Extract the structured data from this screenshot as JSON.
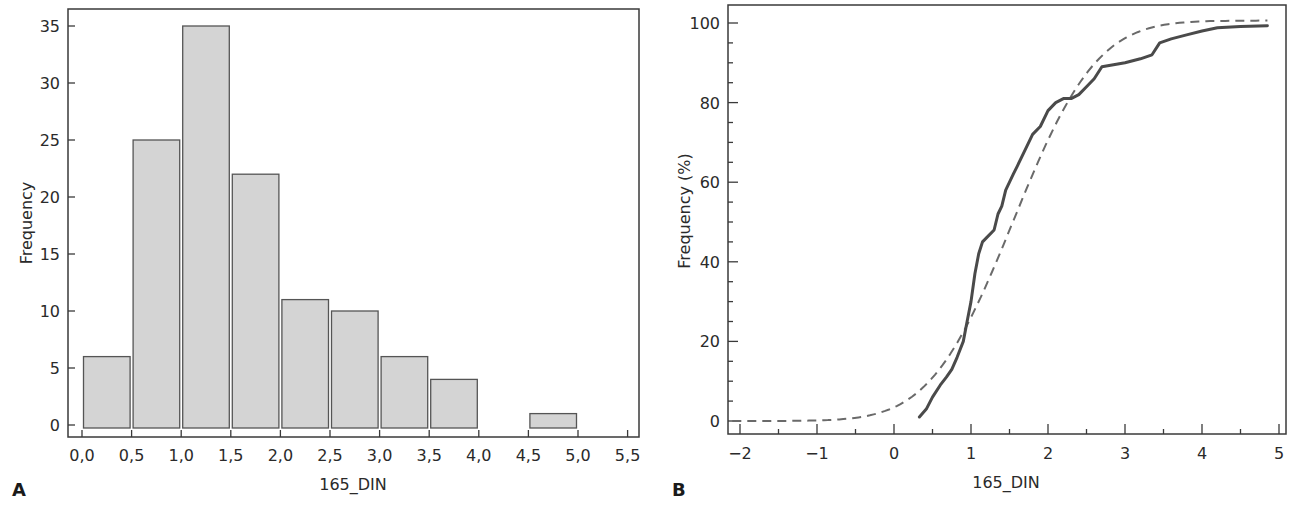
{
  "chart_data": [
    {
      "panel": "A",
      "type": "bar",
      "subtype": "histogram",
      "xlabel": "165_DIN",
      "ylabel": "Frequency",
      "bin_edges": [
        0.0,
        0.5,
        1.0,
        1.5,
        2.0,
        2.5,
        3.0,
        3.5,
        4.0,
        4.5,
        5.0
      ],
      "categories": [
        "0,0–0,5",
        "0,5–1,0",
        "1,0–1,5",
        "1,5–2,0",
        "2,0–2,5",
        "2,5–3,0",
        "3,0–3,5",
        "3,5–4,0",
        "4,0–4,5",
        "4,5–5,0"
      ],
      "values": [
        6,
        25,
        35,
        22,
        11,
        10,
        6,
        4,
        0,
        1
      ],
      "x_ticks": [
        "0,0",
        "0,5",
        "1,0",
        "1,5",
        "2,0",
        "2,5",
        "3,0",
        "3,5",
        "4,0",
        "4,5",
        "5,0",
        "5,5"
      ],
      "y_ticks": [
        "0",
        "5",
        "10",
        "15",
        "20",
        "25",
        "30",
        "35"
      ],
      "xlim": [
        0,
        5.5
      ],
      "ylim": [
        0,
        35
      ],
      "grid": false,
      "bar_color": "#d4d4d4",
      "bar_edge_color": "#555555"
    },
    {
      "panel": "B",
      "type": "line",
      "xlabel": "165_DIN",
      "ylabel": "Frequency (%)",
      "x_ticks": [
        "−2",
        "−1",
        "0",
        "1",
        "2",
        "3",
        "4",
        "5"
      ],
      "y_ticks": [
        "0",
        "20",
        "40",
        "60",
        "80",
        "100"
      ],
      "xlim": [
        -2,
        5
      ],
      "ylim": [
        0,
        100
      ],
      "grid": false,
      "series": [
        {
          "name": "Empirical cumulative frequency",
          "style": "solid",
          "color": "#4a4a4a",
          "x": [
            0.33,
            0.42,
            0.5,
            0.6,
            0.68,
            0.75,
            0.82,
            0.9,
            0.95,
            1.0,
            1.05,
            1.1,
            1.15,
            1.2,
            1.3,
            1.35,
            1.4,
            1.45,
            1.5,
            1.55,
            1.6,
            1.7,
            1.8,
            1.9,
            2.0,
            2.1,
            2.2,
            2.3,
            2.4,
            2.5,
            2.6,
            2.7,
            2.85,
            3.0,
            3.2,
            3.35,
            3.45,
            3.6,
            3.8,
            4.0,
            4.2,
            4.5,
            4.85
          ],
          "y": [
            1,
            3,
            6,
            9,
            11,
            13,
            16,
            20,
            25,
            30,
            37,
            42,
            45,
            46,
            48,
            52,
            54,
            58,
            60,
            62,
            64,
            68,
            72,
            74,
            78,
            80,
            81,
            81,
            82,
            84,
            86,
            89,
            89.5,
            90,
            91,
            92,
            95,
            96,
            97,
            98,
            98.8,
            99.1,
            99.3
          ]
        },
        {
          "name": "Fitted normal cumulative distribution",
          "style": "dashed",
          "color": "#6a6a6a",
          "mean": 1.55,
          "sd": 0.85,
          "x_range": [
            -2.1,
            4.85
          ]
        }
      ]
    }
  ],
  "panels": {
    "a": {
      "letter": "A",
      "xlabel": "165_DIN",
      "ylabel": "Frequency",
      "x_ticks": [
        {
          "v": 0.0,
          "label": "0,0"
        },
        {
          "v": 0.5,
          "label": "0,5"
        },
        {
          "v": 1.0,
          "label": "1,0"
        },
        {
          "v": 1.5,
          "label": "1,5"
        },
        {
          "v": 2.0,
          "label": "2,0"
        },
        {
          "v": 2.5,
          "label": "2,5"
        },
        {
          "v": 3.0,
          "label": "3,0"
        },
        {
          "v": 3.5,
          "label": "3,5"
        },
        {
          "v": 4.0,
          "label": "4,0"
        },
        {
          "v": 4.5,
          "label": "4,5"
        },
        {
          "v": 5.0,
          "label": "5,0"
        },
        {
          "v": 5.5,
          "label": "5,5"
        }
      ],
      "y_ticks": [
        {
          "v": 0,
          "label": "0"
        },
        {
          "v": 5,
          "label": "5"
        },
        {
          "v": 10,
          "label": "10"
        },
        {
          "v": 15,
          "label": "15"
        },
        {
          "v": 20,
          "label": "20"
        },
        {
          "v": 25,
          "label": "25"
        },
        {
          "v": 30,
          "label": "30"
        },
        {
          "v": 35,
          "label": "35"
        }
      ]
    },
    "b": {
      "letter": "B",
      "xlabel": "165_DIN",
      "ylabel": "Frequency (%)",
      "x_ticks": [
        {
          "v": -2,
          "label": "−2"
        },
        {
          "v": -1,
          "label": "−1"
        },
        {
          "v": 0,
          "label": "0"
        },
        {
          "v": 1,
          "label": "1"
        },
        {
          "v": 2,
          "label": "2"
        },
        {
          "v": 3,
          "label": "3"
        },
        {
          "v": 4,
          "label": "4"
        },
        {
          "v": 5,
          "label": "5"
        }
      ],
      "y_ticks": [
        {
          "v": 0,
          "label": "0"
        },
        {
          "v": 20,
          "label": "20"
        },
        {
          "v": 40,
          "label": "40"
        },
        {
          "v": 60,
          "label": "60"
        },
        {
          "v": 80,
          "label": "80"
        },
        {
          "v": 100,
          "label": "100"
        }
      ]
    }
  }
}
